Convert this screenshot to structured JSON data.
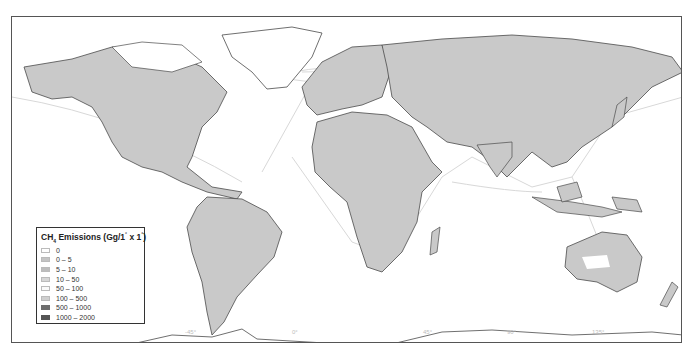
{
  "map": {
    "title": "Global CH4 emissions map",
    "land_color": "#c9c9c9",
    "border_color": "#4a4a4a",
    "ocean_color": "#ffffff",
    "shipping_lane_color": "#d8d8d8",
    "grid_labels": {
      "top": [
        "-135°",
        "-90°",
        "-45°",
        "0°",
        "45°",
        "90°",
        "135°"
      ],
      "left": [
        "45°",
        "0°",
        "-45°"
      ],
      "bottom": [
        "-135°",
        "-90°",
        "-45°",
        "0°",
        "45°",
        "90°",
        "135°"
      ]
    }
  },
  "legend": {
    "title_prefix": "CH",
    "title_sub": "4",
    "title_main": " Emissions (Gg/1",
    "title_deg1": "°",
    "title_mid": " x 1",
    "title_deg2": "°",
    "title_end": ")",
    "items": [
      {
        "label": "0",
        "color": "#ffffff"
      },
      {
        "label": "0 – 5",
        "color": "#c4c4c4"
      },
      {
        "label": "5 – 10",
        "color": "#bdbdbd"
      },
      {
        "label": "10 – 50",
        "color": "#d6d6d6"
      },
      {
        "label": "50 – 100",
        "color": "#fafafa"
      },
      {
        "label": "100 – 500",
        "color": "#cfcfcf"
      },
      {
        "label": "500 – 1000",
        "color": "#6e6e6e"
      },
      {
        "label": "1000 – 2000",
        "color": "#555555"
      }
    ]
  }
}
